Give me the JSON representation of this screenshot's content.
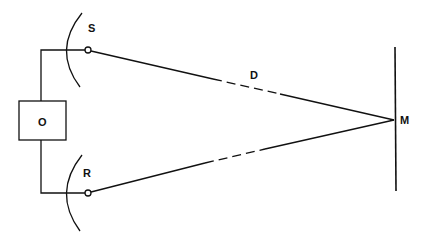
{
  "diagram": {
    "labels": {
      "source": "S",
      "receiver": "R",
      "distance": "D",
      "mirror": "M",
      "oscillator": "O"
    },
    "colors": {
      "stroke": "#111111",
      "background": "#ffffff"
    }
  }
}
